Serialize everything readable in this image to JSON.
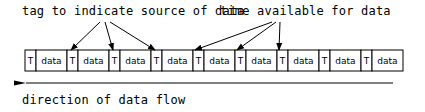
{
  "labels": {
    "tag_label": "tag to indicate source of data",
    "time_label": "time available for data",
    "flow_label": "direction of data flow"
  },
  "frame": {
    "tag_text": "T",
    "data_text": "data",
    "pairs": 9
  },
  "arrows": {
    "tag_targets": [
      2,
      3,
      4
    ],
    "time_targets": [
      5,
      6,
      7
    ],
    "flow_direction": "left"
  },
  "colors": {
    "stroke": "#000000",
    "background": "#ffffff"
  }
}
